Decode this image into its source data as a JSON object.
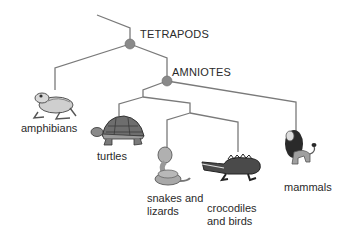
{
  "diagram": {
    "type": "cladogram",
    "colors": {
      "line": "#7a7a7a",
      "node": "#8a8a8a",
      "text": "#2a2a2a"
    },
    "clades": [
      {
        "id": "tetrapods",
        "label": "TETRAPODS"
      },
      {
        "id": "amniotes",
        "label": "AMNIOTES"
      }
    ],
    "taxa": [
      {
        "id": "amphibians",
        "label": "amphibians",
        "icon": "frog-icon"
      },
      {
        "id": "turtles",
        "label": "turtles",
        "icon": "turtle-icon"
      },
      {
        "id": "snakes",
        "label_line1": "snakes and",
        "label_line2": "lizards",
        "icon": "snake-icon"
      },
      {
        "id": "crocodiles",
        "label_line1": "crocodiles",
        "label_line2": "and birds",
        "icon": "crocodile-icon"
      },
      {
        "id": "mammals",
        "label": "mammals",
        "icon": "lion-icon"
      }
    ]
  }
}
